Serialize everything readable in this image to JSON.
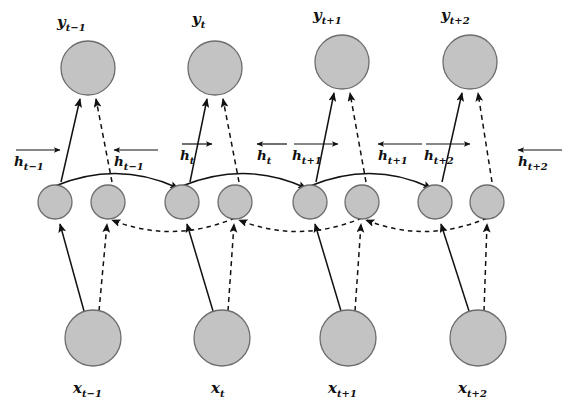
{
  "figure": {
    "kind": "bidirectional-rnn-unrolled-diagram",
    "title": "",
    "background_color": "#ffffff",
    "node_fill_color": "#c3c3c3",
    "node_stroke_color": "#6d6d6d",
    "edge_color": "#111111"
  },
  "chart_data": {
    "type": "diagram",
    "title": "",
    "xlabel": "",
    "ylabel": "",
    "layers": [
      {
        "name": "output-layer",
        "symbol": "y",
        "labels": [
          "y_{t-1}",
          "y_t",
          "y_{t+1}",
          "y_{t+2}"
        ]
      },
      {
        "name": "hidden-layer",
        "symbol": "h",
        "labels": [
          "h_{t-1} forward",
          "h_{t-1} backward",
          "h_t forward",
          "h_t backward",
          "h_{t+1} forward",
          "h_{t+1} backward",
          "h_{t+2} forward",
          "h_{t+2} backward"
        ]
      },
      {
        "name": "input-layer",
        "symbol": "x",
        "labels": [
          "x_{t-1}",
          "x_t",
          "x_{t+1}",
          "x_{t+2}"
        ]
      }
    ],
    "timesteps": [
      "t-1",
      "t",
      "t+1",
      "t+2"
    ],
    "legend": [
      {
        "style": "solid",
        "meaning": "forward pass connections"
      },
      {
        "style": "dashed",
        "meaning": "backward pass connections"
      }
    ]
  },
  "outputs": [
    {
      "id": "y-tm1",
      "base": "y",
      "sub": "t−1",
      "cx": 88,
      "cy": 68,
      "r": 27
    },
    {
      "id": "y-t",
      "base": "y",
      "sub": "t",
      "cx": 215,
      "cy": 68,
      "r": 27
    },
    {
      "id": "y-tp1",
      "base": "y",
      "sub": "t+1",
      "cx": 342,
      "cy": 62,
      "r": 27
    },
    {
      "id": "y-tp2",
      "base": "y",
      "sub": "t+2",
      "cx": 470,
      "cy": 62,
      "r": 27
    }
  ],
  "output_labels": [
    {
      "id": "lbl-y-tm1",
      "base": "y",
      "sub": "t−1",
      "x": 57,
      "y": 27
    },
    {
      "id": "lbl-y-t",
      "base": "y",
      "sub": "t",
      "x": 192,
      "y": 24
    },
    {
      "id": "lbl-y-tp1",
      "base": "y",
      "sub": "t+1",
      "x": 313,
      "y": 20
    },
    {
      "id": "lbl-y-tp2",
      "base": "y",
      "sub": "t+2",
      "x": 441,
      "y": 20
    }
  ],
  "hidden": [
    {
      "id": "h-f-tm1",
      "dir": "forward",
      "cx": 55,
      "cy": 202,
      "r": 17
    },
    {
      "id": "h-b-tm1",
      "dir": "backward",
      "cx": 108,
      "cy": 202,
      "r": 17
    },
    {
      "id": "h-f-t",
      "dir": "forward",
      "cx": 182,
      "cy": 202,
      "r": 17
    },
    {
      "id": "h-b-t",
      "dir": "backward",
      "cx": 235,
      "cy": 202,
      "r": 17
    },
    {
      "id": "h-f-tp1",
      "dir": "forward",
      "cx": 310,
      "cy": 202,
      "r": 17
    },
    {
      "id": "h-b-tp1",
      "dir": "backward",
      "cx": 362,
      "cy": 202,
      "r": 17
    },
    {
      "id": "h-f-tp2",
      "dir": "forward",
      "cx": 435,
      "cy": 202,
      "r": 17
    },
    {
      "id": "h-b-tp2",
      "dir": "backward",
      "cx": 487,
      "cy": 202,
      "r": 17
    }
  ],
  "hidden_labels": [
    {
      "id": "lbl-h-f-tm1",
      "base": "h",
      "sub": "t−1",
      "dir": "forward",
      "x": 14,
      "y": 166,
      "bar_x": 16,
      "bar_y": 150,
      "bar_w": 44
    },
    {
      "id": "lbl-h-b-tm1",
      "base": "h",
      "sub": "t−1",
      "dir": "backward",
      "x": 114,
      "y": 166,
      "bar_x": 114,
      "bar_y": 150,
      "bar_w": 44
    },
    {
      "id": "lbl-h-f-t",
      "base": "h",
      "sub": "t",
      "dir": "forward",
      "x": 180,
      "y": 160,
      "bar_x": 182,
      "bar_y": 144,
      "bar_w": 30
    },
    {
      "id": "lbl-h-b-t",
      "base": "h",
      "sub": "t",
      "dir": "backward",
      "x": 257,
      "y": 160,
      "bar_x": 257,
      "bar_y": 144,
      "bar_w": 30
    },
    {
      "id": "lbl-h-f-tp1",
      "base": "h",
      "sub": "t+1",
      "dir": "forward",
      "x": 292,
      "y": 160,
      "bar_x": 294,
      "bar_y": 144,
      "bar_w": 44
    },
    {
      "id": "lbl-h-b-tp1",
      "base": "h",
      "sub": "t+1",
      "dir": "backward",
      "x": 378,
      "y": 160,
      "bar_x": 378,
      "bar_y": 144,
      "bar_w": 44
    },
    {
      "id": "lbl-h-f-tp2",
      "base": "h",
      "sub": "t+2",
      "dir": "forward",
      "x": 424,
      "y": 160,
      "bar_x": 426,
      "bar_y": 144,
      "bar_w": 44
    },
    {
      "id": "lbl-h-b-tp2",
      "base": "h",
      "sub": "t+2",
      "dir": "backward",
      "x": 518,
      "y": 166,
      "bar_x": 518,
      "bar_y": 150,
      "bar_w": 44
    }
  ],
  "inputs": [
    {
      "id": "x-tm1",
      "base": "x",
      "sub": "t−1",
      "cx": 93,
      "cy": 338,
      "r": 28
    },
    {
      "id": "x-t",
      "base": "x",
      "sub": "t",
      "cx": 222,
      "cy": 338,
      "r": 28
    },
    {
      "id": "x-tp1",
      "base": "x",
      "sub": "t+1",
      "cx": 348,
      "cy": 338,
      "r": 28
    },
    {
      "id": "x-tp2",
      "base": "x",
      "sub": "t+2",
      "cx": 478,
      "cy": 338,
      "r": 28
    }
  ],
  "input_labels": [
    {
      "id": "lbl-x-tm1",
      "base": "x",
      "sub": "t−1",
      "x": 73,
      "y": 393
    },
    {
      "id": "lbl-x-t",
      "base": "x",
      "sub": "t",
      "x": 211,
      "y": 393
    },
    {
      "id": "lbl-x-tp1",
      "base": "x",
      "sub": "t+1",
      "x": 328,
      "y": 393
    },
    {
      "id": "lbl-x-tp2",
      "base": "x",
      "sub": "t+2",
      "x": 458,
      "y": 393
    }
  ],
  "arrow_marker": {
    "width": 7,
    "height": 7,
    "color": "#111111"
  }
}
